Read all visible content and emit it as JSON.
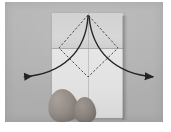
{
  "figure": {
    "kind": "origami-instruction-photo",
    "title": "Origami step: fold both top corners outward along diamond creases",
    "caption": "",
    "palette": {
      "photo_border": "#ffffff",
      "backdrop_gray": "#b4b4b4",
      "paper_upper_gray": "#d4d4d4",
      "paper_lower_gray": "#e4e4e4",
      "crease_line": "#555555",
      "arrow_line": "#2b2b2b",
      "finger_gray": "#8e8884"
    }
  },
  "photo": {
    "label": "photograph",
    "frame": {
      "x": 5,
      "y": 2,
      "width": 158,
      "height": 120
    }
  },
  "paper": {
    "label": "folded paper sheet",
    "bounds": {
      "x": 52,
      "y": 13,
      "width": 71,
      "height": 105
    },
    "creases": [
      {
        "name": "horizontal-flap-edge",
        "from": [
          52,
          48
        ],
        "to": [
          123,
          48
        ],
        "style": "solid-soft"
      },
      {
        "name": "vertical-center",
        "from": [
          88,
          13
        ],
        "to": [
          88,
          118
        ],
        "style": "solid-soft"
      }
    ]
  },
  "fold_guide": {
    "label": "dashed diamond fold guide",
    "style": "dashed",
    "vertices": {
      "top": [
        88,
        15
      ],
      "left": [
        59,
        48
      ],
      "right": [
        118,
        48
      ],
      "bottom": [
        88,
        77
      ]
    },
    "edges": [
      {
        "from": "top",
        "to": "left"
      },
      {
        "from": "left",
        "to": "bottom"
      },
      {
        "from": "bottom",
        "to": "right"
      },
      {
        "from": "right",
        "to": "top"
      }
    ]
  },
  "motion_arrows": [
    {
      "name": "left-fold-arrow",
      "direction": "outward-left",
      "start": [
        88,
        16
      ],
      "control1": [
        86,
        52
      ],
      "control2": [
        62,
        74
      ],
      "end": [
        22,
        77
      ],
      "head_at": [
        22,
        77
      ],
      "head_angle_deg": 186
    },
    {
      "name": "right-fold-arrow",
      "direction": "outward-right",
      "start": [
        89,
        16
      ],
      "control1": [
        92,
        52
      ],
      "control2": [
        116,
        74
      ],
      "end": [
        155,
        77
      ],
      "head_at": [
        155,
        77
      ],
      "head_angle_deg": -6
    }
  ],
  "hand": {
    "label": "hand holding paper",
    "fingers": [
      {
        "name": "index-finger",
        "x": 48,
        "y": 89,
        "width": 30,
        "height": 33,
        "rotation_deg": -9
      },
      {
        "name": "middle-finger",
        "x": 74,
        "y": 97,
        "width": 22,
        "height": 26,
        "rotation_deg": -4
      }
    ]
  }
}
